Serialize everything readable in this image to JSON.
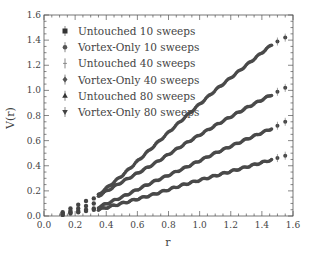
{
  "chart_data": {
    "type": "scatter",
    "title": "",
    "xlabel": "r",
    "ylabel": "V(r)",
    "xlim": [
      0.0,
      1.6
    ],
    "ylim": [
      0.0,
      1.6
    ],
    "xticks": [
      "0.0",
      "0.2",
      "0.4",
      "0.6",
      "0.8",
      "1.0",
      "1.2",
      "1.4",
      "1.6"
    ],
    "yticks": [
      "0.0",
      "0.2",
      "0.4",
      "0.6",
      "0.8",
      "1.0",
      "1.2",
      "1.4",
      "1.6"
    ],
    "grid": false,
    "legend_position": "upper left",
    "legend": [
      "Untouched 10 sweeps",
      "Vortex-Only 10 sweeps",
      "Untouched 40 sweeps",
      "Vortex-Only 40 sweeps",
      "Untouched 80 sweeps",
      "Vortex-Only 80 sweeps"
    ],
    "curve_groups": [
      {
        "name": "group-1 (steepest)",
        "x": [
          0.12,
          0.17,
          0.22,
          0.27,
          0.32,
          0.35,
          0.5,
          0.7,
          0.9,
          1.1,
          1.3,
          1.47,
          1.55
        ],
        "values": [
          0.03,
          0.06,
          0.09,
          0.12,
          0.14,
          0.17,
          0.32,
          0.55,
          0.78,
          1.0,
          1.2,
          1.37,
          1.42
        ]
      },
      {
        "name": "group-2",
        "x": [
          0.12,
          0.17,
          0.22,
          0.27,
          0.32,
          0.35,
          0.5,
          0.7,
          0.9,
          1.1,
          1.3,
          1.47,
          1.55
        ],
        "values": [
          0.02,
          0.04,
          0.06,
          0.08,
          0.1,
          0.16,
          0.27,
          0.41,
          0.57,
          0.72,
          0.86,
          0.97,
          1.02
        ]
      },
      {
        "name": "group-3",
        "x": [
          0.12,
          0.17,
          0.22,
          0.27,
          0.32,
          0.35,
          0.5,
          0.7,
          0.9,
          1.1,
          1.3,
          1.47,
          1.55
        ],
        "values": [
          0.01,
          0.03,
          0.04,
          0.05,
          0.06,
          0.07,
          0.15,
          0.27,
          0.38,
          0.5,
          0.61,
          0.7,
          0.75
        ]
      },
      {
        "name": "group-4 (shallowest)",
        "x": [
          0.12,
          0.17,
          0.22,
          0.27,
          0.32,
          0.35,
          0.5,
          0.7,
          0.9,
          1.1,
          1.3,
          1.47,
          1.55
        ],
        "values": [
          0.01,
          0.02,
          0.03,
          0.04,
          0.05,
          0.05,
          0.1,
          0.17,
          0.25,
          0.32,
          0.39,
          0.45,
          0.48
        ]
      }
    ]
  }
}
